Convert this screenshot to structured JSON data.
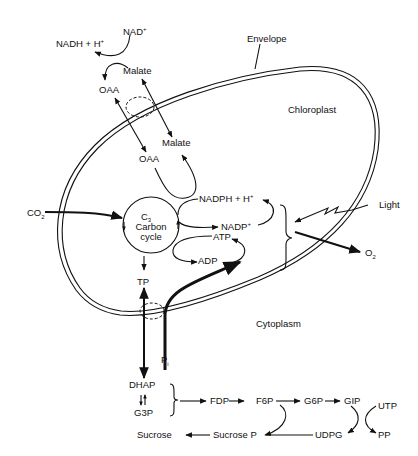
{
  "diagram": {
    "title": "",
    "regions": {
      "envelope": "Envelope",
      "chloroplast": "Chloroplast",
      "cytoplasm": "Cytoplasm"
    },
    "cycle": {
      "line1": "C",
      "line1_sub": "3",
      "line2": "Carbon",
      "line3": "cycle"
    },
    "nodes": {
      "nadh": "NADH + H",
      "nadh_sup": "+",
      "nad": "NAD",
      "nad_sup": "+",
      "malate_out": "Malate",
      "oaa_out": "OAA",
      "malate_in": "Malate",
      "oaa_in": "OAA",
      "nadph": "NADPH + H",
      "nadph_sup": "+",
      "nadp": "NADP",
      "nadp_sup": "+",
      "atp": "ATP",
      "adp": "ADP",
      "co2": "CO",
      "co2_sub": "2",
      "light": "Light",
      "o2": "O",
      "o2_sub": "2",
      "tp": "TP",
      "pi": "P",
      "pi_sub": "i",
      "dhap": "DHAP",
      "g3p": "G3P",
      "fdp": "FDP",
      "f6p": "F6P",
      "g6p": "G6P",
      "gip": "GIP",
      "utp": "UTP",
      "udpg": "UDPG",
      "pp": "PP",
      "sucrose_p": "Sucrose P",
      "sucrose": "Sucrose"
    },
    "edges": [
      {
        "from": "NAD+",
        "to": "NADH + H+"
      },
      {
        "from": "Malate",
        "to": "OAA"
      },
      {
        "from": "OAA (cytoplasm)",
        "to": "OAA (chloroplast)",
        "bidirectional": true
      },
      {
        "from": "Malate (cytoplasm)",
        "to": "Malate (chloroplast)",
        "bidirectional": true
      },
      {
        "from": "OAA (chloroplast)",
        "to": "Malate (chloroplast)",
        "via": "NADPH + H+"
      },
      {
        "from": "CO2",
        "to": "C3 Carbon cycle"
      },
      {
        "from": "C3 Carbon cycle",
        "to": "NADP+"
      },
      {
        "from": "NADP+",
        "to": "NADPH + H+"
      },
      {
        "from": "ADP",
        "to": "ATP"
      },
      {
        "from": "C3 Carbon cycle",
        "to": "ADP"
      },
      {
        "from": "Light",
        "to": "light reactions"
      },
      {
        "from": "light reactions",
        "to": "O2"
      },
      {
        "from": "C3 Carbon cycle",
        "to": "TP"
      },
      {
        "from": "TP",
        "to": "DHAP",
        "bidirectional": true
      },
      {
        "from": "Pi",
        "to": "ADP"
      },
      {
        "from": "DHAP",
        "to": "G3P",
        "bidirectional": true
      },
      {
        "from": "DHAP/G3P",
        "to": "FDP"
      },
      {
        "from": "FDP",
        "to": "F6P"
      },
      {
        "from": "F6P",
        "to": "G6P"
      },
      {
        "from": "G6P",
        "to": "GIP"
      },
      {
        "from": "GIP + UTP",
        "to": "UDPG + PP"
      },
      {
        "from": "UDPG + F6P",
        "to": "Sucrose P"
      },
      {
        "from": "Sucrose P",
        "to": "Sucrose"
      }
    ]
  }
}
